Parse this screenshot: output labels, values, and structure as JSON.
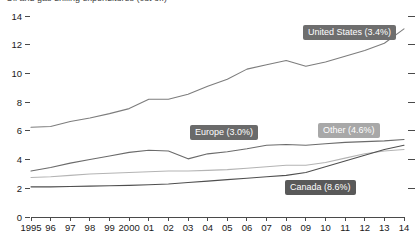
{
  "title": "Oil and gas drilling expenditures (cut off)",
  "chart_data": {
    "type": "line",
    "title": "",
    "xlabel": "",
    "ylabel": "",
    "grid": false,
    "legend_position": "inline-callout",
    "ylim": [
      0,
      14
    ],
    "yticks": [
      0,
      2,
      4,
      6,
      8,
      10,
      12,
      14
    ],
    "ytick_labels": [
      "0",
      "2",
      "4",
      "6",
      "8",
      "10",
      "12",
      "14"
    ],
    "x": [
      1995,
      1996,
      1997,
      1998,
      1999,
      2000,
      2001,
      2002,
      2003,
      2004,
      2005,
      2006,
      2007,
      2008,
      2009,
      2010,
      2011,
      2012,
      2013,
      2014
    ],
    "xtick_labels": [
      "1995",
      "96",
      "97",
      "98",
      "99",
      "2000",
      "01",
      "02",
      "03",
      "04",
      "05",
      "06",
      "07",
      "08",
      "09",
      "10",
      "11",
      "12",
      "13",
      "14"
    ],
    "series": [
      {
        "name": "United States",
        "label": "United States (3.4%)",
        "color": "#7d7d7d",
        "values": [
          6.25,
          6.3,
          6.65,
          6.9,
          7.2,
          7.55,
          8.2,
          8.2,
          8.55,
          9.1,
          9.6,
          10.3,
          10.6,
          10.9,
          10.5,
          10.8,
          11.2,
          11.6,
          12.1,
          13.1
        ]
      },
      {
        "name": "Europe",
        "label": "Europe (3.0%)",
        "color": "#6b6b6b",
        "values": [
          3.2,
          3.45,
          3.75,
          4.0,
          4.25,
          4.5,
          4.65,
          4.6,
          4.05,
          4.4,
          4.55,
          4.75,
          5.0,
          5.05,
          5.0,
          5.1,
          5.2,
          5.25,
          5.3,
          5.4
        ]
      },
      {
        "name": "Other",
        "label": "Other (4.6%)",
        "color": "#b4b4b4",
        "values": [
          2.75,
          2.8,
          2.9,
          3.0,
          3.05,
          3.1,
          3.15,
          3.2,
          3.2,
          3.25,
          3.3,
          3.4,
          3.5,
          3.6,
          3.6,
          3.8,
          4.1,
          4.4,
          4.6,
          4.7
        ]
      },
      {
        "name": "Canada",
        "label": "Canada (8.6%)",
        "color": "#4f4f4f",
        "values": [
          2.1,
          2.1,
          2.12,
          2.15,
          2.18,
          2.2,
          2.25,
          2.3,
          2.4,
          2.5,
          2.6,
          2.7,
          2.8,
          2.9,
          3.1,
          3.5,
          3.9,
          4.3,
          4.7,
          5.0
        ]
      }
    ]
  },
  "labels": {
    "united_states": "United States (3.4%)",
    "europe": "Europe (3.0%)",
    "other": "Other (4.6%)",
    "canada": "Canada (8.6%)"
  },
  "colors": {
    "united_states": "#7d7d7d",
    "europe": "#6b6b6b",
    "other": "#b4b4b4",
    "canada": "#4f4f4f",
    "axis": "#4a4a4a",
    "background": "#ffffff"
  }
}
